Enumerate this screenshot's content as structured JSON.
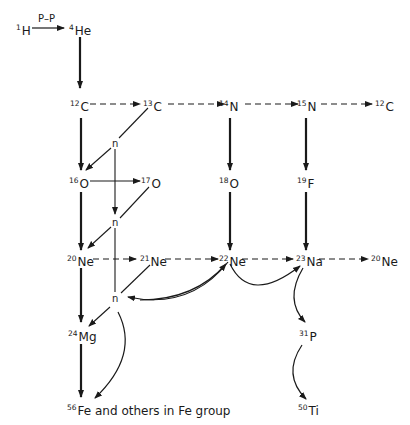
{
  "diagram": {
    "type": "nucleosynthesis-network",
    "process_label": "P–P",
    "nodes": {
      "h1": {
        "mass": "1",
        "symbol": "H"
      },
      "he4": {
        "mass": "4",
        "symbol": "He"
      },
      "c12": {
        "mass": "12",
        "symbol": "C"
      },
      "c13": {
        "mass": "13",
        "symbol": "C"
      },
      "n14": {
        "mass": "14",
        "symbol": "N"
      },
      "n15": {
        "mass": "15",
        "symbol": "N"
      },
      "c12b": {
        "mass": "12",
        "symbol": "C"
      },
      "n_a": {
        "symbol": "n"
      },
      "o16": {
        "mass": "16",
        "symbol": "O"
      },
      "o17": {
        "mass": "17",
        "symbol": "O"
      },
      "o18": {
        "mass": "18",
        "symbol": "O"
      },
      "f19": {
        "mass": "19",
        "symbol": "F"
      },
      "n_b": {
        "symbol": "n"
      },
      "ne20": {
        "mass": "20",
        "symbol": "Ne"
      },
      "ne21": {
        "mass": "21",
        "symbol": "Ne"
      },
      "ne22": {
        "mass": "22",
        "symbol": "Ne"
      },
      "na23": {
        "mass": "23",
        "symbol": "Na"
      },
      "ne20b": {
        "mass": "20",
        "symbol": "Ne"
      },
      "n_c": {
        "symbol": "n"
      },
      "mg24": {
        "mass": "24",
        "symbol": "Mg"
      },
      "p31": {
        "mass": "31",
        "symbol": "P"
      },
      "fe56": {
        "mass": "56",
        "symbol": "Fe and others in Fe group"
      },
      "ti50": {
        "mass": "50",
        "symbol": "Ti"
      }
    },
    "edges": [
      {
        "from": "1H",
        "to": "4He",
        "style": "solid-thin",
        "label": "P–P"
      },
      {
        "from": "4He",
        "to": "12C",
        "style": "solid-bold"
      },
      {
        "from": "12C",
        "to": "13C",
        "style": "dashed"
      },
      {
        "from": "13C",
        "to": "14N",
        "style": "dashed"
      },
      {
        "from": "14N",
        "to": "15N",
        "style": "dashed"
      },
      {
        "from": "15N",
        "to": "12C",
        "style": "dashed"
      },
      {
        "from": "12C",
        "to": "16O",
        "style": "solid-bold"
      },
      {
        "from": "13C",
        "to": "n",
        "style": "solid-thin"
      },
      {
        "from": "n",
        "to": "16O",
        "style": "solid-thin"
      },
      {
        "from": "14N",
        "to": "18O",
        "style": "solid-bold"
      },
      {
        "from": "15N",
        "to": "19F",
        "style": "solid-bold"
      },
      {
        "from": "16O",
        "to": "17O",
        "style": "solid-thin"
      },
      {
        "from": "17O",
        "to": "n",
        "style": "solid-thin"
      },
      {
        "from": "n",
        "to": "20Ne",
        "style": "solid-thin"
      },
      {
        "from": "16O",
        "to": "20Ne",
        "style": "solid-bold"
      },
      {
        "from": "18O",
        "to": "22Ne",
        "style": "solid-bold"
      },
      {
        "from": "19F",
        "to": "23Na",
        "style": "solid-bold"
      },
      {
        "from": "20Ne",
        "to": "21Ne",
        "style": "dashed"
      },
      {
        "from": "21Ne",
        "to": "22Ne",
        "style": "dashed"
      },
      {
        "from": "22Ne",
        "to": "23Na",
        "style": "dashed"
      },
      {
        "from": "23Na",
        "to": "20Ne",
        "style": "dashed"
      },
      {
        "from": "21Ne",
        "to": "n",
        "style": "solid-thin"
      },
      {
        "from": "22Ne",
        "to": "n",
        "style": "curved"
      },
      {
        "from": "n",
        "to": "22Ne",
        "style": "curved"
      },
      {
        "from": "22Ne",
        "to": "23Na",
        "style": "curved"
      },
      {
        "from": "20Ne",
        "to": "24Mg",
        "style": "solid-bold"
      },
      {
        "from": "n",
        "to": "24Mg",
        "style": "solid-thin"
      },
      {
        "from": "n",
        "to": "56Fe",
        "style": "curved"
      },
      {
        "from": "24Mg",
        "to": "56Fe",
        "style": "solid-bold"
      },
      {
        "from": "23Na",
        "to": "31P",
        "style": "curved"
      },
      {
        "from": "31P",
        "to": "50Ti",
        "style": "curved"
      }
    ]
  }
}
